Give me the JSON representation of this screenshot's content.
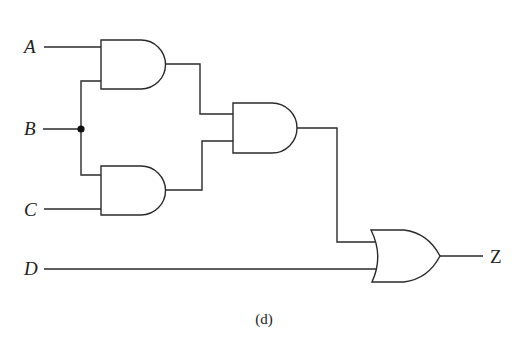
{
  "diagram": {
    "type": "logic-circuit",
    "caption": "(d)",
    "inputs": [
      {
        "id": "A",
        "label": "A"
      },
      {
        "id": "B",
        "label": "B"
      },
      {
        "id": "C",
        "label": "C"
      },
      {
        "id": "D",
        "label": "D"
      }
    ],
    "output": {
      "id": "Z",
      "label": "Z"
    },
    "gates": [
      {
        "id": "and1",
        "type": "AND",
        "inputs": [
          "A",
          "B"
        ]
      },
      {
        "id": "and2",
        "type": "AND",
        "inputs": [
          "B",
          "C"
        ]
      },
      {
        "id": "and3",
        "type": "AND",
        "inputs": [
          "and1",
          "and2"
        ]
      },
      {
        "id": "or1",
        "type": "OR",
        "inputs": [
          "and3",
          "D"
        ],
        "output": "Z"
      }
    ],
    "junctions": [
      {
        "id": "junction-b",
        "net": "B"
      }
    ],
    "colors": {
      "stroke": "#2a2a2a",
      "background": "#ffffff",
      "text": "#222222"
    }
  }
}
